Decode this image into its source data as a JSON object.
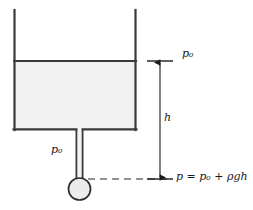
{
  "figure": {
    "type": "physics-diagram",
    "width": 253,
    "height": 210,
    "background_color": "#ffffff"
  },
  "labels": {
    "surface_pressure": "p₀",
    "tube_pressure": "p₀",
    "depth": "h",
    "pressure_equation": "p = p₀ + ρgh"
  },
  "colors": {
    "outline": "#3a3a3a",
    "fluid_fill": "#f1f1f1",
    "bulb_fill": "#ececec",
    "dashed_line": "#6e6e6e",
    "arrow": "#1a1a1a",
    "text": "#1a1a1a"
  },
  "geometry": {
    "tank": {
      "left_x": 14,
      "right_x": 136,
      "top_y": 10,
      "bottom_y": 130
    },
    "fluid_surface_y": 61,
    "tube": {
      "center_x": 79.5,
      "half_width": 3.5,
      "top_y": 130,
      "bottom_y": 186
    },
    "bulb": {
      "center_x": 79.5,
      "center_y": 189,
      "radius": 11
    },
    "datum_line": {
      "y": 179,
      "x_start": 88,
      "x_end": 168
    },
    "dimension_arrow": {
      "x": 160,
      "top_y": 61,
      "bottom_y": 179
    }
  },
  "annotations": {
    "surface_tick": {
      "x_start": 147,
      "x_end": 173,
      "y": 61
    },
    "datum_tick": {
      "x_start": 147,
      "x_end": 173,
      "y": 179
    }
  }
}
